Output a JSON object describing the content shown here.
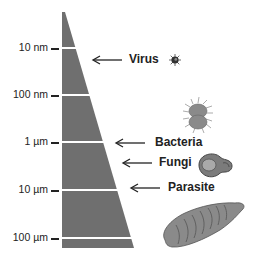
{
  "diagram": {
    "type": "size-scale",
    "colors": {
      "wedge": "#6f6f6f",
      "band_lines": "#ffffff",
      "organism_fill": "#8a8a8a",
      "text": "#222222"
    },
    "scale": [
      {
        "label": "10 nm",
        "y": 48
      },
      {
        "label": "100 nm",
        "y": 95
      },
      {
        "label": "1 µm",
        "y": 142
      },
      {
        "label": "10 µm",
        "y": 190
      },
      {
        "label": "100 µm",
        "y": 238
      }
    ],
    "organisms": [
      {
        "label": "Virus",
        "icon": "virus-icon"
      },
      {
        "label": "Bacteria",
        "icon": "bacteria-icon"
      },
      {
        "label": "Fungi",
        "icon": "fungi-icon"
      },
      {
        "label": "Parasite",
        "icon": "parasite-icon"
      }
    ]
  }
}
